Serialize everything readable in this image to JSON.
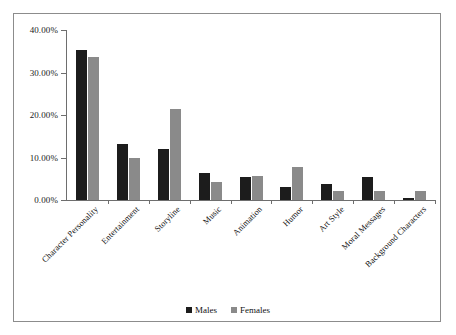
{
  "chart_data": {
    "type": "bar",
    "title": "",
    "xlabel": "",
    "ylabel": "",
    "ylim": [
      0,
      40
    ],
    "ytick_labels": [
      "40.00%",
      "30.00%",
      "20.00%",
      "10.00%",
      "0.00%"
    ],
    "ytick_values": [
      40,
      30,
      20,
      10,
      0
    ],
    "grid": false,
    "legend_position": "bottom-center",
    "categories": [
      "Character Personality",
      "Entertainment",
      "Storyline",
      "Music",
      "Animation",
      "Humor",
      "Art Style",
      "Moral Messages",
      "Background Characters"
    ],
    "series": [
      {
        "name": "Males",
        "color": "#1c1c1c",
        "values": [
          35.2,
          13.1,
          11.9,
          6.4,
          5.5,
          3.1,
          3.8,
          5.5,
          0.5
        ]
      },
      {
        "name": "Females",
        "color": "#8a8a8a",
        "values": [
          33.6,
          10.0,
          21.4,
          4.3,
          5.7,
          7.8,
          2.1,
          2.2,
          2.1
        ]
      }
    ]
  },
  "legend": {
    "items": [
      {
        "label": "Males",
        "color": "#1c1c1c"
      },
      {
        "label": "Females",
        "color": "#8a8a8a"
      }
    ]
  }
}
